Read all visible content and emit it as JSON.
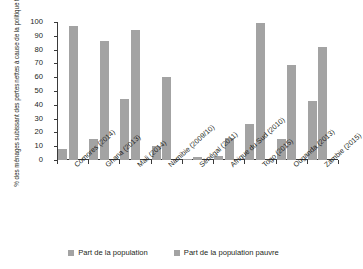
{
  "chart_data": {
    "type": "bar",
    "title": "",
    "xlabel": "",
    "ylabel": "% des ménages subissant des pertes nettes à cause de la politique fiscale",
    "ylabel_lines": [
      "% des ménages subissant des pertes",
      "nettes à cause de la politique fiscale"
    ],
    "ylim": [
      0,
      100
    ],
    "yticks": [
      0,
      10,
      20,
      30,
      40,
      50,
      60,
      70,
      80,
      90,
      100
    ],
    "grid": false,
    "legend_position": "bottom",
    "bar_color": "#a3a3a3",
    "axis_color": "#3a3a3a",
    "categories": [
      "Comores (2014)",
      "Ghana (2013)",
      "Mali (2014)",
      "Namibie (2009/10)",
      "Sénégal (2011)",
      "Afrique du Sud (2010)",
      "Togo (2015)",
      "Ouganda (2013)",
      "Zambie (2015)"
    ],
    "series": [
      {
        "name": "Part de la population",
        "values": [
          8,
          15,
          44,
          10,
          1,
          3,
          26,
          15,
          43
        ]
      },
      {
        "name": "Part de la population pauvre",
        "values": [
          97,
          86,
          94,
          60,
          2,
          16,
          99,
          69,
          82
        ]
      }
    ]
  },
  "legend": {
    "items": [
      {
        "label": "Part de la population"
      },
      {
        "label": "Part de la population pauvre"
      }
    ]
  }
}
